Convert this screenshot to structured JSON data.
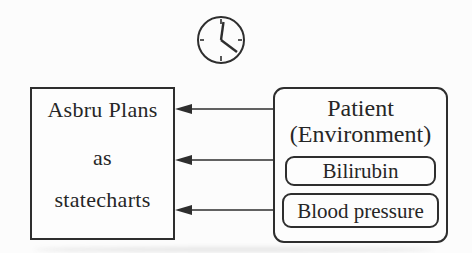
{
  "colors": {
    "ink": "#2e2e2e",
    "background": "#fcfcfc"
  },
  "icons": {
    "clock": "clock-icon",
    "arrow": "arrow-left-icon"
  },
  "left_box": {
    "lines": [
      "Asbru Plans",
      "as",
      "statecharts"
    ]
  },
  "right_box": {
    "title_lines": [
      "Patient",
      "(Environment)"
    ],
    "sub_boxes": [
      {
        "label": "Bilirubin"
      },
      {
        "label": "Blood pressure"
      }
    ]
  },
  "arrows": {
    "count": 3,
    "direction": "right-to-left",
    "from": "Patient (Environment)",
    "to": "Asbru Plans as statecharts"
  }
}
